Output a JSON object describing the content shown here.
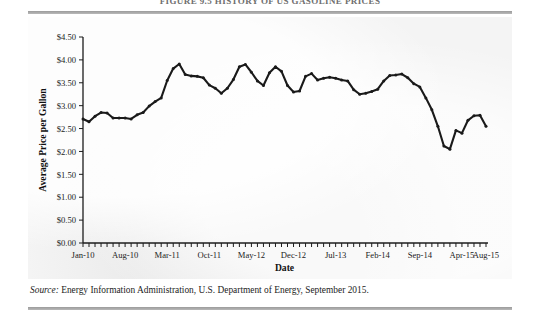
{
  "figure": {
    "clipped_heading": "FIGURE 9.5 HISTORY OF US GASOLINE PRICES",
    "source_prefix": "Source:",
    "source_text": "Energy Information Administration, U.S. Department of Energy, September 2015.",
    "rule_color": "#9b9b9b",
    "panel_color": "#f4f4f4",
    "line_color": "#1a1a1a"
  },
  "chart_data": {
    "type": "line",
    "title": "",
    "xlabel": "Date",
    "ylabel": "Average Price per Gallon",
    "ylim": [
      0,
      4.5
    ],
    "ytick_step": 0.5,
    "ytick_labels": [
      "$0.00",
      "$0.50",
      "$1.00",
      "$1.50",
      "$2.00",
      "$2.50",
      "$3.00",
      "$3.50",
      "$4.00",
      "$4.50"
    ],
    "ytick_values": [
      0,
      0.5,
      1.0,
      1.5,
      2.0,
      2.5,
      3.0,
      3.5,
      4.0,
      4.5
    ],
    "xtick_labels": [
      "Jan-10",
      "Aug-10",
      "Mar-11",
      "Oct-11",
      "May-12",
      "Dec-12",
      "Jul-13",
      "Feb-14",
      "Sep-14",
      "Apr-15",
      "Aug-15"
    ],
    "xtick_indices": [
      0,
      7,
      14,
      21,
      28,
      35,
      42,
      49,
      56,
      63,
      67
    ],
    "grid": false,
    "legend": null,
    "markers": true,
    "x": [
      "Jan-10",
      "Feb-10",
      "Mar-10",
      "Apr-10",
      "May-10",
      "Jun-10",
      "Jul-10",
      "Aug-10",
      "Sep-10",
      "Oct-10",
      "Nov-10",
      "Dec-10",
      "Jan-11",
      "Feb-11",
      "Mar-11",
      "Apr-11",
      "May-11",
      "Jun-11",
      "Jul-11",
      "Aug-11",
      "Sep-11",
      "Oct-11",
      "Nov-11",
      "Dec-11",
      "Jan-12",
      "Feb-12",
      "Mar-12",
      "Apr-12",
      "May-12",
      "Jun-12",
      "Jul-12",
      "Aug-12",
      "Sep-12",
      "Oct-12",
      "Nov-12",
      "Dec-12",
      "Jan-13",
      "Feb-13",
      "Mar-13",
      "Apr-13",
      "May-13",
      "Jun-13",
      "Jul-13",
      "Aug-13",
      "Sep-13",
      "Oct-13",
      "Nov-13",
      "Dec-13",
      "Jan-14",
      "Feb-14",
      "Mar-14",
      "Apr-14",
      "May-14",
      "Jun-14",
      "Jul-14",
      "Aug-14",
      "Sep-14",
      "Oct-14",
      "Nov-14",
      "Dec-14",
      "Jan-15",
      "Feb-15",
      "Mar-15",
      "Apr-15",
      "May-15",
      "Jun-15",
      "Jul-15",
      "Aug-15"
    ],
    "values": [
      2.71,
      2.65,
      2.77,
      2.85,
      2.84,
      2.73,
      2.73,
      2.73,
      2.71,
      2.8,
      2.85,
      2.99,
      3.09,
      3.17,
      3.55,
      3.81,
      3.91,
      3.68,
      3.65,
      3.64,
      3.61,
      3.45,
      3.38,
      3.27,
      3.38,
      3.57,
      3.85,
      3.9,
      3.73,
      3.54,
      3.44,
      3.72,
      3.85,
      3.75,
      3.44,
      3.3,
      3.32,
      3.64,
      3.7,
      3.56,
      3.6,
      3.62,
      3.6,
      3.56,
      3.54,
      3.35,
      3.25,
      3.27,
      3.31,
      3.36,
      3.54,
      3.66,
      3.67,
      3.69,
      3.61,
      3.48,
      3.41,
      3.17,
      2.91,
      2.55,
      2.12,
      2.05,
      2.46,
      2.4,
      2.68,
      2.78,
      2.79,
      2.55
    ],
    "y_min_point": {
      "label": "Feb-15",
      "value": 2.05
    },
    "y_max_point": {
      "label": "Apr-12",
      "value": 3.9
    },
    "units": "USD per gallon"
  }
}
